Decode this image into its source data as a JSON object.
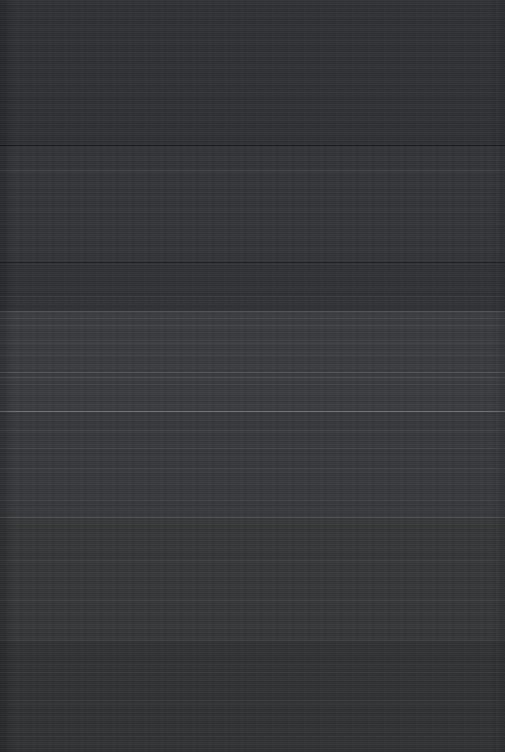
{
  "capture": {
    "width": 505,
    "height": 752,
    "description": "Dark screen capture with no legible interface content",
    "state_label": "blank-dark-screen",
    "visible_text": "",
    "base_color": "#333538",
    "has_text": false,
    "has_icons": false,
    "has_controls": false
  },
  "surface": {
    "bands": [
      {
        "name": "band-top",
        "top": 0,
        "height": 145,
        "color": "#303235"
      },
      {
        "name": "band-upper-mid",
        "top": 145,
        "height": 117,
        "color": "#343639"
      },
      {
        "name": "band-mid",
        "top": 262,
        "height": 49,
        "color": "#313336"
      },
      {
        "name": "band-light-upper",
        "top": 311,
        "height": 100,
        "color": "#3a3c3f"
      },
      {
        "name": "band-light-lower",
        "top": 411,
        "height": 106,
        "color": "#383a3d"
      },
      {
        "name": "band-lower-mid",
        "top": 517,
        "height": 123,
        "color": "#363839"
      },
      {
        "name": "band-bottom",
        "top": 640,
        "height": 112,
        "color": "#313335"
      }
    ],
    "rules": [
      {
        "name": "rule-dark-145",
        "top": 145,
        "color": "rgba(0,0,0,0.55)",
        "height": 1
      },
      {
        "name": "rule-light-170",
        "top": 170,
        "color": "rgba(255,255,255,0.075)",
        "height": 1
      },
      {
        "name": "rule-dark-262",
        "top": 262,
        "color": "rgba(0,0,0,0.40)",
        "height": 1
      },
      {
        "name": "rule-light-296",
        "top": 296,
        "color": "rgba(255,255,255,0.055)",
        "height": 1
      },
      {
        "name": "rule-light-311",
        "top": 311,
        "color": "rgba(255,255,255,0.13)",
        "height": 1
      },
      {
        "name": "rule-light-318",
        "top": 318,
        "color": "rgba(255,255,255,0.10)",
        "height": 1
      },
      {
        "name": "rule-light-325",
        "top": 325,
        "color": "rgba(255,255,255,0.07)",
        "height": 1
      },
      {
        "name": "rule-light-343",
        "top": 343,
        "color": "rgba(255,255,255,0.055)",
        "height": 1
      },
      {
        "name": "rule-light-355",
        "top": 355,
        "color": "rgba(255,255,255,0.05)",
        "height": 1
      },
      {
        "name": "rule-light-372",
        "top": 372,
        "color": "rgba(255,255,255,0.14)",
        "height": 1
      },
      {
        "name": "rule-light-377",
        "top": 377,
        "color": "rgba(255,255,255,0.11)",
        "height": 1
      },
      {
        "name": "rule-light-384",
        "top": 384,
        "color": "rgba(255,255,255,0.06)",
        "height": 1
      },
      {
        "name": "rule-bright-411",
        "top": 411,
        "color": "rgba(255,255,255,0.30)",
        "height": 1
      },
      {
        "name": "rule-light-430",
        "top": 430,
        "color": "rgba(255,255,255,0.05)",
        "height": 1
      },
      {
        "name": "rule-light-448",
        "top": 448,
        "color": "rgba(255,255,255,0.07)",
        "height": 1
      },
      {
        "name": "rule-light-468",
        "top": 468,
        "color": "rgba(255,255,255,0.045)",
        "height": 1
      },
      {
        "name": "rule-light-500",
        "top": 500,
        "color": "rgba(255,255,255,0.05)",
        "height": 1
      },
      {
        "name": "rule-light-517",
        "top": 517,
        "color": "rgba(255,255,255,0.16)",
        "height": 1
      },
      {
        "name": "rule-light-560",
        "top": 560,
        "color": "rgba(255,255,255,0.035)",
        "height": 1
      },
      {
        "name": "rule-light-600",
        "top": 600,
        "color": "rgba(255,255,255,0.035)",
        "height": 1
      },
      {
        "name": "rule-light-640",
        "top": 640,
        "color": "rgba(255,255,255,0.05)",
        "height": 1
      },
      {
        "name": "rule-light-672",
        "top": 672,
        "color": "rgba(255,255,255,0.035)",
        "height": 1
      },
      {
        "name": "rule-light-700",
        "top": 700,
        "color": "rgba(255,255,255,0.045)",
        "height": 1
      },
      {
        "name": "rule-light-736",
        "top": 736,
        "color": "rgba(255,255,255,0.030)",
        "height": 1
      }
    ]
  }
}
